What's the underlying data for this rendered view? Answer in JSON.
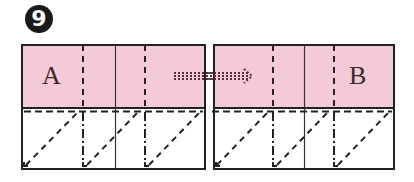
{
  "step": {
    "number": "9"
  },
  "panels": [
    {
      "id": "left",
      "label": "A"
    },
    {
      "id": "right",
      "label": "B"
    }
  ],
  "colors": {
    "paper_pink": "#F5CAD8",
    "paper_white": "#FFFFFF",
    "line": "#222222",
    "badge": "#1a1a1a"
  },
  "legend": {
    "dashed_line": "valley-fold",
    "dash_dot_line": "mountain-fold",
    "dotted_arrow": "slide-direction"
  }
}
